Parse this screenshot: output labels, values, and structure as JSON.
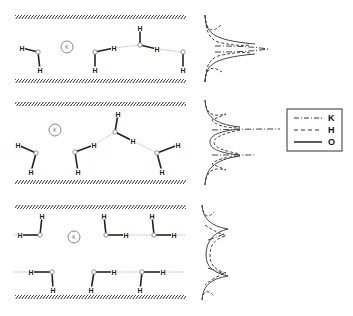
{
  "figure": {
    "panels": [
      {
        "id": "panel-1",
        "ion_label": "K",
        "wall_top_y": 17,
        "wall_bottom_y": 81,
        "ion": {
          "x": 67,
          "y": 47,
          "r": 6
        },
        "molecules": [
          {
            "O": [
              38,
              52
            ],
            "H": [
              [
                22,
                48
              ],
              [
                40,
                70
              ]
            ]
          },
          {
            "O": [
              95,
              52
            ],
            "H": [
              [
                114,
                48
              ],
              [
                95,
                70
              ]
            ]
          },
          {
            "O": [
              140,
              45
            ],
            "H": [
              [
                140,
                28
              ],
              [
                157,
                49
              ]
            ]
          },
          {
            "O": [
              183,
              52
            ],
            "H": [
              [
                183,
                70
              ]
            ]
          }
        ],
        "hbonds": [
          [
            [
              114,
              48
            ],
            [
              140,
              45
            ]
          ],
          [
            [
              157,
              49
            ],
            [
              183,
              52
            ]
          ]
        ]
      },
      {
        "id": "panel-2",
        "ion_label": "K",
        "wall_top_y": 104,
        "wall_bottom_y": 182,
        "ion": {
          "x": 55,
          "y": 130,
          "r": 6
        },
        "molecules": [
          {
            "O": [
              36,
              153
            ],
            "H": [
              [
                18,
                145
              ],
              [
                31,
                172
              ]
            ]
          },
          {
            "O": [
              75,
              152
            ],
            "H": [
              [
                94,
                145
              ],
              [
                78,
                172
              ]
            ]
          },
          {
            "O": [
              115,
              132
            ],
            "H": [
              [
                118,
                114
              ],
              [
                133,
                141
              ]
            ]
          },
          {
            "O": [
              157,
              153
            ],
            "H": [
              [
                178,
                145
              ],
              [
                162,
                172
              ]
            ]
          }
        ],
        "hbonds": [
          [
            [
              94,
              145
            ],
            [
              115,
              132
            ]
          ],
          [
            [
              133,
              141
            ],
            [
              157,
              153
            ]
          ]
        ]
      },
      {
        "id": "panel-3",
        "ion_label": "K",
        "wall_top_y": 207,
        "wall_bottom_y": 297,
        "ion": {
          "x": 74,
          "y": 237,
          "r": 6
        },
        "molecules": [
          {
            "O": [
              40,
              235
            ],
            "H": [
              [
                20,
                235
              ],
              [
                42,
                216
              ]
            ]
          },
          {
            "O": [
              106,
              235
            ],
            "H": [
              [
                126,
                235
              ],
              [
                104,
                216
              ]
            ]
          },
          {
            "O": [
              154,
              235
            ],
            "H": [
              [
                174,
                235
              ],
              [
                152,
                216
              ]
            ]
          },
          {
            "O": [
              52,
              272
            ],
            "H": [
              [
                31,
                272
              ],
              [
                53,
                290
              ]
            ]
          },
          {
            "O": [
              94,
              272
            ],
            "H": [
              [
                114,
                272
              ],
              [
                91,
                290
              ]
            ]
          },
          {
            "O": [
              142,
              272
            ],
            "H": [
              [
                163,
                272
              ],
              [
                140,
                290
              ]
            ]
          }
        ],
        "hbonds": [
          [
            [
              14,
              235
            ],
            [
              20,
              235
            ]
          ],
          [
            [
              126,
              235
            ],
            [
              154,
              235
            ]
          ],
          [
            [
              174,
              235
            ],
            [
              186,
              235
            ]
          ],
          [
            [
              14,
              272
            ],
            [
              31,
              272
            ]
          ],
          [
            [
              114,
              272
            ],
            [
              142,
              272
            ]
          ],
          [
            [
              163,
              272
            ],
            [
              184,
              272
            ]
          ]
        ]
      }
    ],
    "legend": {
      "items": [
        {
          "label": "K",
          "style": "dash-dot"
        },
        {
          "label": "H",
          "style": "dashed"
        },
        {
          "label": "O",
          "style": "solid"
        }
      ]
    },
    "atom_labels": {
      "hydrogen": "H",
      "oxygen": "O"
    },
    "colors": {
      "wall": "#333333",
      "bond": "#222222",
      "hbond": "#bbbbbb",
      "curve": "#444444"
    }
  }
}
